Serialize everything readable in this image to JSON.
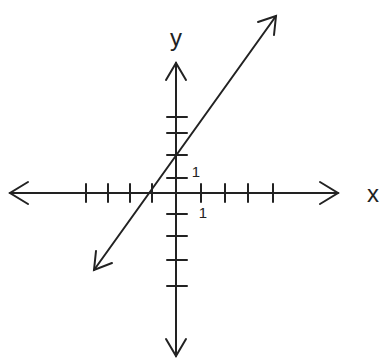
{
  "diagram": {
    "type": "coordinate-plane",
    "axis_labels": {
      "x": "x",
      "y": "y"
    },
    "unit_labels": {
      "x_unit": "1",
      "y_unit": "1"
    },
    "x_ticks": [
      -4,
      -3,
      -2,
      -1,
      1,
      2,
      3,
      4
    ],
    "y_ticks": [
      -4,
      -3,
      -2,
      -1,
      1,
      2,
      3,
      4
    ],
    "line": {
      "equation": "y = 2x + 2",
      "slope": 2,
      "y_intercept": 2,
      "x_intercept": -1,
      "arrows": "both ends"
    },
    "colors": {
      "ink": "#222222",
      "background": "#ffffff"
    }
  }
}
